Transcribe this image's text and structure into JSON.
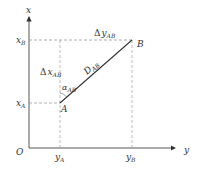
{
  "diagram": {
    "axes": {
      "vertical_label": "x",
      "horizontal_label": "y",
      "origin_label": "O"
    },
    "points": {
      "A": {
        "label": "A"
      },
      "B": {
        "label": "B"
      }
    },
    "ticks": {
      "xA": {
        "main": "x",
        "sub": "A"
      },
      "xB": {
        "main": "x",
        "sub": "B"
      },
      "yA": {
        "main": "y",
        "sub": "A"
      },
      "yB": {
        "main": "y",
        "sub": "B"
      }
    },
    "annotations": {
      "delta_x": {
        "prefix": "Δ",
        "main": "x",
        "sub": "AB"
      },
      "delta_y": {
        "prefix": "Δ",
        "main": "y",
        "sub": "AB"
      },
      "distance": {
        "main": "D",
        "sub": "AB"
      },
      "azimuth": {
        "main": "α",
        "sub": "AB"
      }
    },
    "colors": {
      "axis": "#444444",
      "dashed": "#999999",
      "segment": "#333333"
    }
  }
}
